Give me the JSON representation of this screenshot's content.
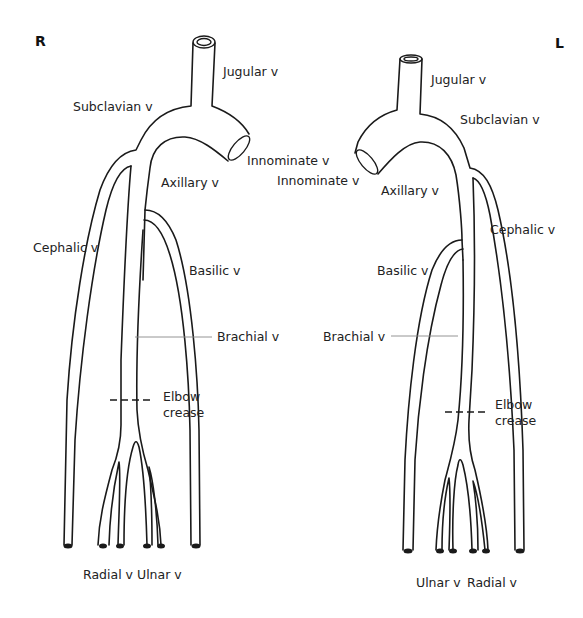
{
  "diagram": {
    "sides": {
      "right": {
        "marker": "R"
      },
      "left": {
        "marker": "L"
      }
    },
    "right_arm": {
      "labels": {
        "jugular": "Jugular v",
        "subclavian": "Subclavian v",
        "innominate": "Innominate v",
        "axillary": "Axillary v",
        "cephalic": "Cephalic v",
        "basilic": "Basilic v",
        "brachial": "Brachial v",
        "elbow_line1": "Elbow",
        "elbow_line2": "crease",
        "radial": "Radial v",
        "ulnar": "Ulnar v"
      }
    },
    "left_arm": {
      "labels": {
        "jugular": "Jugular v",
        "subclavian": "Subclavian v",
        "innominate": "Innominate v",
        "axillary": "Axillary v",
        "cephalic": "Cephalic v",
        "basilic": "Basilic v",
        "brachial": "Brachial v",
        "elbow_line1": "Elbow",
        "elbow_line2": "crease",
        "ulnar": "Ulnar v",
        "radial": "Radial v"
      }
    },
    "colors": {
      "line": "#1a1a1a",
      "leader": "#888888",
      "text": "#222222",
      "background": "#ffffff"
    }
  }
}
